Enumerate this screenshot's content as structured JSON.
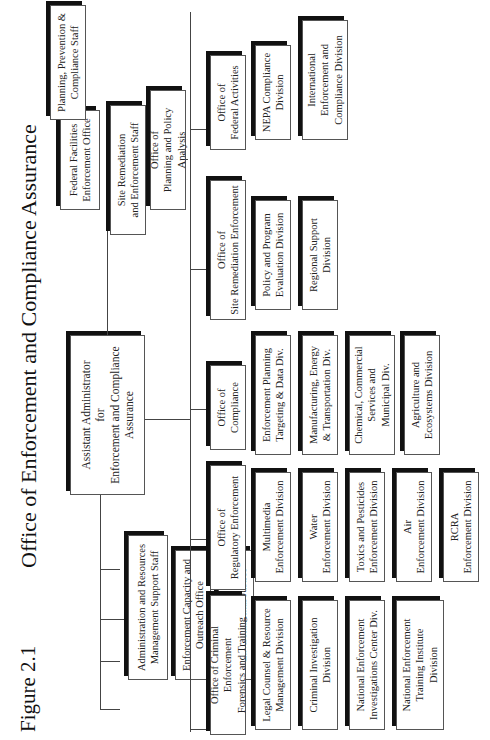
{
  "figure_label": "Figure 2.1",
  "title": "Office of Enforcement and Compliance Assurance",
  "head": {
    "label": "Assistant Administrator\nfor\nEnforcement and Compliance\nAssurance"
  },
  "staff_left": [
    {
      "label": "Administration and Resources\nManagement Support Staff"
    },
    {
      "label": "Enforcement Capacity and\nOutreach Office"
    },
    {
      "label": "Office of\nEnvironmental Justice"
    }
  ],
  "staff_right": [
    {
      "label": "Federal Facilities\nEnforcement Office"
    },
    {
      "label": "Site Remediation\nand Enforcement Staff"
    },
    {
      "label": "Planning, Prevention &\nCompliance Staff"
    }
  ],
  "planning_office": {
    "label": "Office of\nPlanning and Policy Analysis"
  },
  "offices": [
    {
      "label": "Office of Criminal Enforcement\nForensics and Training",
      "divisions": [
        "Legal Counsel & Resource\nManagement Division",
        "Criminal Investigation\nDivision",
        "National Enforcement\nInvestigations Center Div.",
        "National Enforcement\nTraining Institute\nDivision"
      ]
    },
    {
      "label": "Office of\nRegulatory Enforcement",
      "divisions": [
        "Multimedia\nEnforcement Division",
        "Water\nEnforcement Division",
        "Toxics and Pesticides\nEnforcement Division",
        "Air\nEnforcement Division",
        "RCRA\nEnforcement Division"
      ]
    },
    {
      "label": "Office of\nCompliance",
      "divisions": [
        "Enforcement Planning\nTargeting & Data Div.",
        "Manufacturing, Energy\n& Transportation Div.",
        "Chemical, Commercial\nServices and\nMunicipal Div.",
        "Agriculture and\nEcosystems Division"
      ]
    },
    {
      "label": "Office of\nSite Remediation Enforcement",
      "divisions": [
        "Policy and Program\nEvaluation Division",
        "Regional Support\nDivision"
      ]
    },
    {
      "label": "Office of\nFederal Activities",
      "divisions": [
        "NEPA Compliance\nDivision",
        "International\nEnforcement and\nCompliance Division"
      ]
    }
  ]
}
